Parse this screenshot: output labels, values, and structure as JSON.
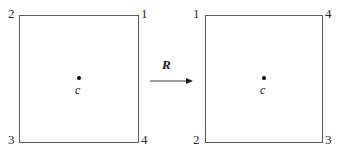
{
  "figure": {
    "type": "transformation-diagram",
    "background_color": "#ffffff",
    "line_color": "#5b5b5b",
    "text_color": "#1a1a1a"
  },
  "left_square": {
    "name": "source-square",
    "corner_labels": {
      "top_left": "2",
      "top_right": "1",
      "bottom_left": "3",
      "bottom_right": "4"
    },
    "center": {
      "dot": "•",
      "label": "c"
    }
  },
  "right_square": {
    "name": "image-square",
    "corner_labels": {
      "top_left": "1",
      "top_right": "4",
      "bottom_left": "2",
      "bottom_right": "3"
    },
    "center": {
      "dot": "•",
      "label": "c"
    }
  },
  "arrow": {
    "label": "R",
    "direction": "right",
    "meaning": "rotation"
  }
}
